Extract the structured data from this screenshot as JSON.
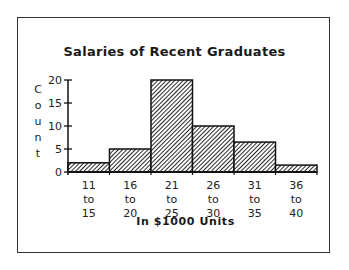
{
  "chart_data": {
    "type": "bar",
    "title": "Salaries of Recent Graduates",
    "xlabel": "In $1000 Units",
    "ylabel": "Count",
    "categories": [
      "11 to 15",
      "16 to 20",
      "21 to 25",
      "26 to 30",
      "31 to 35",
      "36 to 40"
    ],
    "category_lines": [
      [
        "11",
        "to",
        "15"
      ],
      [
        "16",
        "to",
        "20"
      ],
      [
        "21",
        "to",
        "25"
      ],
      [
        "26",
        "to",
        "30"
      ],
      [
        "31",
        "to",
        "35"
      ],
      [
        "36",
        "to",
        "40"
      ]
    ],
    "values": [
      2,
      5,
      20,
      10,
      6.5,
      1.5
    ],
    "ylim": [
      0,
      20
    ],
    "yticks": [
      0,
      5,
      10,
      15,
      20
    ],
    "grid": false,
    "legend": null,
    "bar_fill": "diagonal-hatch",
    "histogram": true
  },
  "title": "Salaries of Recent Graduates",
  "xaxis_title": "In $1000 Units",
  "ylabel_letters": [
    "C",
    "o",
    "u",
    "n",
    "t"
  ]
}
